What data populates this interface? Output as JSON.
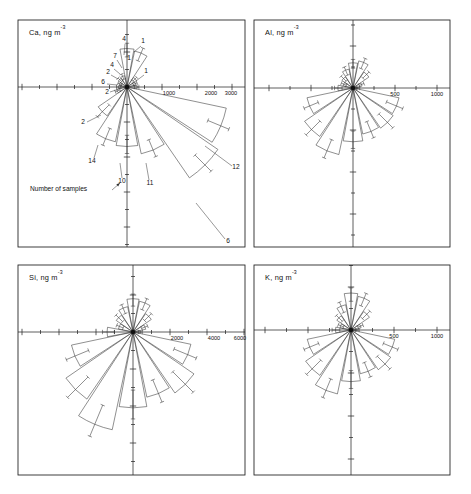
{
  "figure": {
    "background": "#ffffff",
    "line_color": "#333333",
    "width": 471,
    "height": 494,
    "annotation": {
      "text": "Number of samples",
      "x": 30,
      "y": 191
    }
  },
  "chart_data": {
    "type": "scatter",
    "plot_kind": "wind-rose / polar-bar",
    "title": "",
    "subtitle": "",
    "xlabel": "",
    "ylabel": "",
    "grid": false,
    "legend_position": "none",
    "panel_layout": "2x2",
    "units": "ng m-3",
    "annotations": [
      "Number of samples"
    ],
    "panels": [
      {
        "id": "ca",
        "element": "Ca",
        "label": "Ca, ng m",
        "label_exponent": "-3",
        "frame": {
          "x": 18,
          "y": 20,
          "w": 227,
          "h": 227
        },
        "origin": {
          "x": 127,
          "y": 87
        },
        "axis_ticks": [
          1000,
          2000,
          3000
        ],
        "tick_labels": [
          "1000",
          "2000",
          "3000"
        ],
        "tick_label_x": [
          169,
          211,
          231
        ],
        "tick_spacing_px": 35,
        "xlim": [
          -3400,
          3400
        ],
        "ylim": [
          -3400,
          3400
        ],
        "sample_counts_shown": true,
        "sectors": [
          {
            "dir_deg": 0,
            "value": 290,
            "count": "1",
            "whisker": 340
          },
          {
            "dir_deg": 22.5,
            "value": 2900,
            "count": "12",
            "whisker": 3150
          },
          {
            "dir_deg": 45,
            "value": 3150,
            "count": "6",
            "whisker": 3400
          },
          {
            "dir_deg": 67.5,
            "value": 1950,
            "count": "11",
            "whisker": 2150
          },
          {
            "dir_deg": 90,
            "value": 1700,
            "count": "10",
            "whisker": 1900
          },
          {
            "dir_deg": 112.5,
            "value": 1600,
            "count": "14",
            "whisker": 1800
          },
          {
            "dir_deg": 135,
            "value": 1000,
            "count": "2",
            "whisker": 1200
          },
          {
            "dir_deg": 157.5,
            "value": 300,
            "count": "2",
            "whisker": 360
          },
          {
            "dir_deg": 180,
            "value": 240,
            "count": "6",
            "whisker": 300
          },
          {
            "dir_deg": 202.5,
            "value": 230,
            "count": "4",
            "whisker": 280
          },
          {
            "dir_deg": 225,
            "value": 300,
            "count": "7",
            "whisker": 360
          },
          {
            "dir_deg": 247.5,
            "value": 330,
            "count": "1",
            "whisker": 400
          },
          {
            "dir_deg": 270,
            "value": 1100,
            "count": "4",
            "whisker": 1250
          },
          {
            "dir_deg": 292.5,
            "value": 1050,
            "count": "1",
            "whisker": 1200
          },
          {
            "dir_deg": 315,
            "value": 330,
            "count": "1",
            "whisker": 390
          },
          {
            "dir_deg": 337.5,
            "value": 260,
            "count": "1",
            "whisker": 310
          }
        ],
        "count_labels": [
          {
            "text": "4",
            "x": 124,
            "y": 41,
            "lx1": 125,
            "ly1": 44,
            "lx2": 124,
            "ly2": 55
          },
          {
            "text": "1",
            "x": 143,
            "y": 43,
            "lx1": 141,
            "ly1": 46,
            "lx2": 134,
            "ly2": 52
          },
          {
            "text": "1",
            "x": 129,
            "y": 60,
            "lx1": 0,
            "ly1": 0,
            "lx2": 0,
            "ly2": 0
          },
          {
            "text": "7",
            "x": 115,
            "y": 58,
            "lx1": 117,
            "ly1": 60,
            "lx2": 122,
            "ly2": 68
          },
          {
            "text": "4",
            "x": 112,
            "y": 67,
            "lx1": 114,
            "ly1": 69,
            "lx2": 120,
            "ly2": 74
          },
          {
            "text": "2",
            "x": 108,
            "y": 74,
            "lx1": 111,
            "ly1": 75,
            "lx2": 118,
            "ly2": 79
          },
          {
            "text": "6",
            "x": 103,
            "y": 84,
            "lx1": 107,
            "ly1": 84,
            "lx2": 117,
            "ly2": 85
          },
          {
            "text": "2",
            "x": 107,
            "y": 94,
            "lx1": 110,
            "ly1": 92,
            "lx2": 119,
            "ly2": 89
          },
          {
            "text": "1",
            "x": 146,
            "y": 73,
            "lx1": 144,
            "ly1": 75,
            "lx2": 136,
            "ly2": 81
          },
          {
            "text": "2",
            "x": 83,
            "y": 124,
            "lx1": 87,
            "ly1": 122,
            "lx2": 101,
            "ly2": 115
          },
          {
            "text": "14",
            "x": 92,
            "y": 163,
            "lx1": 94,
            "ly1": 158,
            "lx2": 98,
            "ly2": 145
          },
          {
            "text": "10",
            "x": 122,
            "y": 183,
            "lx1": 122,
            "ly1": 178,
            "lx2": 120,
            "ly2": 163
          },
          {
            "text": "11",
            "x": 150,
            "y": 185,
            "lx1": 149,
            "ly1": 180,
            "lx2": 146,
            "ly2": 163
          },
          {
            "text": "12",
            "x": 236,
            "y": 169,
            "lx1": 232,
            "ly1": 166,
            "lx2": 205,
            "ly2": 146
          },
          {
            "text": "6",
            "x": 228,
            "y": 243,
            "lx1": 225,
            "ly1": 239,
            "lx2": 196,
            "ly2": 203
          }
        ]
      },
      {
        "id": "al",
        "element": "Al",
        "label": "Al, ng m",
        "label_exponent": "-3",
        "frame": {
          "x": 254,
          "y": 20,
          "w": 196,
          "h": 227
        },
        "origin": {
          "x": 353,
          "y": 88
        },
        "axis_ticks": [
          500,
          1000
        ],
        "tick_labels": [
          "500",
          "1000"
        ],
        "tick_label_x": [
          395,
          437
        ],
        "tick_spacing_px": 42,
        "xlim": [
          -1200,
          1200
        ],
        "ylim": [
          -1200,
          1200
        ],
        "sample_counts_shown": false,
        "sectors": [
          {
            "dir_deg": 0,
            "value": 60,
            "whisker": 80
          },
          {
            "dir_deg": 22.5,
            "value": 560,
            "whisker": 640
          },
          {
            "dir_deg": 45,
            "value": 580,
            "whisker": 670
          },
          {
            "dir_deg": 67.5,
            "value": 560,
            "whisker": 640
          },
          {
            "dir_deg": 90,
            "value": 640,
            "whisker": 720
          },
          {
            "dir_deg": 112.5,
            "value": 810,
            "whisker": 900
          },
          {
            "dir_deg": 135,
            "value": 700,
            "whisker": 790
          },
          {
            "dir_deg": 157.5,
            "value": 560,
            "whisker": 630
          },
          {
            "dir_deg": 180,
            "value": 180,
            "whisker": 220
          },
          {
            "dir_deg": 202.5,
            "value": 120,
            "whisker": 150
          },
          {
            "dir_deg": 225,
            "value": 160,
            "whisker": 200
          },
          {
            "dir_deg": 247.5,
            "value": 230,
            "whisker": 270
          },
          {
            "dir_deg": 270,
            "value": 300,
            "whisker": 340
          },
          {
            "dir_deg": 292.5,
            "value": 330,
            "whisker": 380
          },
          {
            "dir_deg": 315,
            "value": 230,
            "whisker": 270
          },
          {
            "dir_deg": 337.5,
            "value": 110,
            "whisker": 140
          }
        ],
        "count_labels": []
      },
      {
        "id": "si",
        "element": "Si",
        "label": "Si, ng m",
        "label_exponent": "-3",
        "frame": {
          "x": 18,
          "y": 265,
          "w": 227,
          "h": 210
        },
        "origin": {
          "x": 133,
          "y": 332
        },
        "axis_ticks": [
          2000,
          4000,
          6000
        ],
        "tick_labels": [
          "2000",
          "4000",
          "6000"
        ],
        "tick_label_x": [
          177,
          214,
          240
        ],
        "tick_spacing_px": 37,
        "xlim": [
          -6800,
          6800
        ],
        "ylim": [
          -6800,
          6800
        ],
        "sample_counts_shown": false,
        "sectors": [
          {
            "dir_deg": 0,
            "value": 400,
            "whisker": 500
          },
          {
            "dir_deg": 22.5,
            "value": 3200,
            "whisker": 3700
          },
          {
            "dir_deg": 45,
            "value": 4000,
            "whisker": 4600
          },
          {
            "dir_deg": 67.5,
            "value": 3600,
            "whisker": 4100
          },
          {
            "dir_deg": 90,
            "value": 4100,
            "whisker": 4700
          },
          {
            "dir_deg": 112.5,
            "value": 5400,
            "whisker": 6100
          },
          {
            "dir_deg": 135,
            "value": 4400,
            "whisker": 5000
          },
          {
            "dir_deg": 157.5,
            "value": 3400,
            "whisker": 3900
          },
          {
            "dir_deg": 180,
            "value": 1400,
            "whisker": 1650
          },
          {
            "dir_deg": 202.5,
            "value": 800,
            "whisker": 950
          },
          {
            "dir_deg": 225,
            "value": 1100,
            "whisker": 1300
          },
          {
            "dir_deg": 247.5,
            "value": 1400,
            "whisker": 1600
          },
          {
            "dir_deg": 270,
            "value": 1800,
            "whisker": 2050
          },
          {
            "dir_deg": 292.5,
            "value": 1700,
            "whisker": 1950
          },
          {
            "dir_deg": 315,
            "value": 1200,
            "whisker": 1400
          },
          {
            "dir_deg": 337.5,
            "value": 700,
            "whisker": 850
          }
        ],
        "count_labels": []
      },
      {
        "id": "k",
        "element": "K",
        "label": "K, ng m",
        "label_exponent": "-3",
        "frame": {
          "x": 254,
          "y": 265,
          "w": 196,
          "h": 210
        },
        "origin": {
          "x": 351,
          "y": 330
        },
        "axis_ticks": [
          500,
          1000
        ],
        "tick_labels": [
          "500",
          "1000"
        ],
        "tick_label_x": [
          394,
          437
        ],
        "tick_spacing_px": 43,
        "xlim": [
          -1150,
          1150
        ],
        "ylim": [
          -1150,
          1150
        ],
        "sample_counts_shown": false,
        "sectors": [
          {
            "dir_deg": 0,
            "value": 70,
            "whisker": 95
          },
          {
            "dir_deg": 22.5,
            "value": 520,
            "whisker": 590
          },
          {
            "dir_deg": 45,
            "value": 560,
            "whisker": 640
          },
          {
            "dir_deg": 67.5,
            "value": 520,
            "whisker": 590
          },
          {
            "dir_deg": 90,
            "value": 600,
            "whisker": 680
          },
          {
            "dir_deg": 112.5,
            "value": 760,
            "whisker": 850
          },
          {
            "dir_deg": 135,
            "value": 640,
            "whisker": 730
          },
          {
            "dir_deg": 157.5,
            "value": 520,
            "whisker": 590
          },
          {
            "dir_deg": 180,
            "value": 180,
            "whisker": 220
          },
          {
            "dir_deg": 202.5,
            "value": 130,
            "whisker": 160
          },
          {
            "dir_deg": 225,
            "value": 200,
            "whisker": 240
          },
          {
            "dir_deg": 247.5,
            "value": 300,
            "whisker": 350
          },
          {
            "dir_deg": 270,
            "value": 430,
            "whisker": 490
          },
          {
            "dir_deg": 292.5,
            "value": 400,
            "whisker": 460
          },
          {
            "dir_deg": 315,
            "value": 260,
            "whisker": 310
          },
          {
            "dir_deg": 337.5,
            "value": 120,
            "whisker": 150
          }
        ],
        "count_labels": []
      }
    ]
  }
}
